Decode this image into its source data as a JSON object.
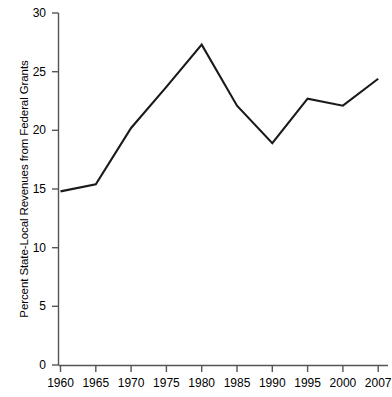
{
  "chart_data": {
    "type": "line",
    "title": "",
    "xlabel": "",
    "ylabel": "Percent State-Local Revenues from Federal Grants",
    "categories": [
      "1960",
      "1965",
      "1970",
      "1975",
      "1980",
      "1985",
      "1990",
      "1995",
      "2000",
      "2007"
    ],
    "values": [
      14.8,
      15.4,
      20.2,
      23.7,
      27.3,
      22.1,
      18.9,
      22.7,
      22.1,
      24.4
    ],
    "series": [
      {
        "name": "Percent State-Local Revenues from Federal Grants",
        "values": [
          14.8,
          15.4,
          20.2,
          23.7,
          27.3,
          22.1,
          18.9,
          22.7,
          22.1,
          24.4
        ]
      }
    ],
    "ylim": [
      0,
      30
    ],
    "y_ticks": [
      "0",
      "5",
      "10",
      "15",
      "20",
      "25",
      "30"
    ],
    "y_tick_values": [
      0,
      5,
      10,
      15,
      20,
      25,
      30
    ],
    "x_ticks": [
      "1960",
      "1965",
      "1970",
      "1975",
      "1980",
      "1985",
      "1990",
      "1995",
      "2000",
      "2007"
    ],
    "grid": false,
    "legend": "none",
    "line_color": "#1a1a1a",
    "axis_color": "#555555"
  }
}
